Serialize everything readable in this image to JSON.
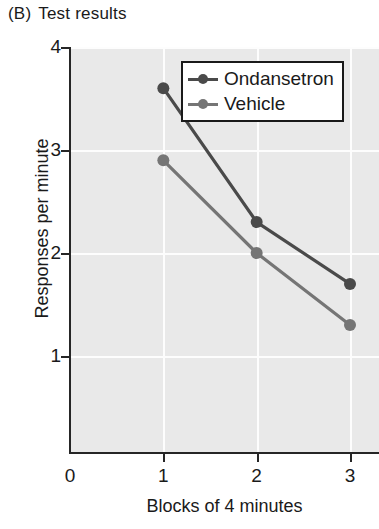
{
  "panel": {
    "letter": "(B)",
    "title": "Test results"
  },
  "chart_data": {
    "type": "line",
    "xlabel": "Blocks of 4 minutes",
    "ylabel": "Responses per minute",
    "x": [
      1,
      2,
      3
    ],
    "xticklabels": [
      "0",
      "1",
      "2",
      "3"
    ],
    "xtickvalues": [
      0,
      1,
      2,
      3
    ],
    "yticklabels": [
      "1",
      "2",
      "3",
      "4"
    ],
    "ytickvalues": [
      1,
      2,
      3,
      4
    ],
    "xlim": [
      0,
      3.3
    ],
    "ylim": [
      0.3,
      4
    ],
    "grid": true,
    "legend_position": "top-right-inside",
    "plot_background": "#e9e9e9",
    "gridline_color": "#fdfdfd",
    "series": [
      {
        "name": "Ondansetron",
        "color": "#4a4a4a",
        "marker": "circle",
        "values": [
          3.6,
          2.3,
          1.7
        ]
      },
      {
        "name": "Vehicle",
        "color": "#757575",
        "marker": "circle",
        "values": [
          2.9,
          2.0,
          1.3
        ]
      }
    ]
  }
}
